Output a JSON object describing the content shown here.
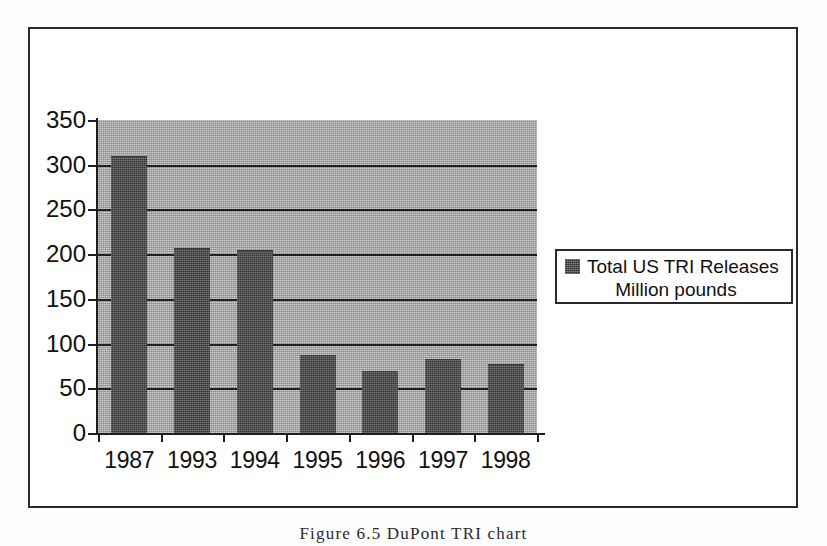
{
  "figure": {
    "caption": "Figure 6.5   DuPont TRI chart"
  },
  "legend": {
    "line1": "Total US TRI Releases",
    "line2": "Million pounds",
    "swatch_color": "#4d4d4d"
  },
  "colors": {
    "plot_background": "#a9a9a9",
    "bar_fill": "#4d4d4d",
    "axis": "#1f1f1f",
    "frame": "#2a2a2a",
    "page_background": "#ffffff"
  },
  "chart_data": {
    "type": "bar",
    "title": "",
    "xlabel": "",
    "ylabel": "",
    "categories": [
      "1987",
      "1993",
      "1994",
      "1995",
      "1996",
      "1997",
      "1998"
    ],
    "values": [
      309,
      206,
      203,
      86,
      68,
      82,
      76
    ],
    "series": [
      {
        "name": "Total US TRI Releases Million pounds",
        "values": [
          309,
          206,
          203,
          86,
          68,
          82,
          76
        ]
      }
    ],
    "ylim": [
      0,
      350
    ],
    "ytick_step": 50,
    "yticks": [
      350,
      300,
      250,
      200,
      150,
      100,
      50,
      0
    ],
    "ytick_labels": [
      "350",
      "300",
      "250",
      "200",
      "150",
      "100",
      "50",
      "0"
    ],
    "grid": true,
    "grid_axis": "y",
    "legend_position": "right",
    "legend_entries": [
      "Total US TRI Releases Million pounds"
    ]
  }
}
